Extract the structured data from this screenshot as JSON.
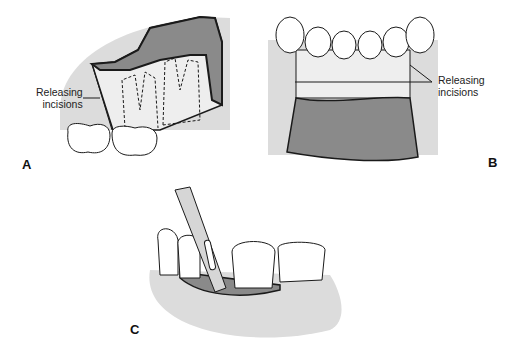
{
  "figure": {
    "panels": [
      {
        "letter": "A",
        "label_line1": "Releasing",
        "label_line2": "incisions"
      },
      {
        "letter": "B",
        "label_line1": "Releasing",
        "label_line2": "incisions"
      },
      {
        "letter": "C"
      }
    ]
  },
  "colors": {
    "gingiva": "#dcdcdc",
    "flap_dark": "#8a8a8a",
    "outline": "#1a1a1a",
    "tooth": "#ffffff"
  }
}
